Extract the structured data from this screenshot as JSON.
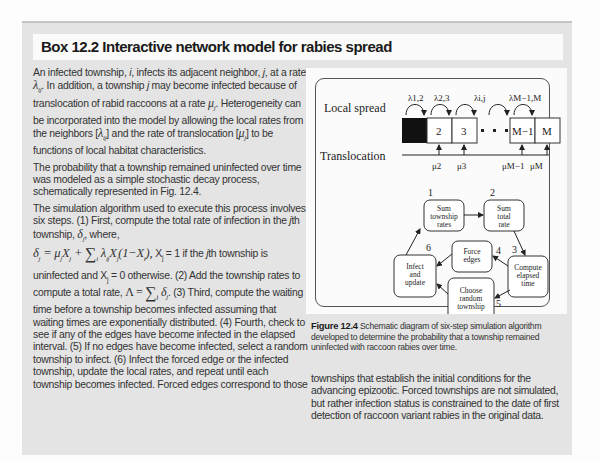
{
  "box": {
    "title": "Box 12.2  Interactive network model for rabies spread"
  },
  "left_column": {
    "paragraphs": [
      "An infected township, i, infects its adjacent neighbor, j, at a rate λij. In addition, a township j may become infected because of translocation of rabid raccoons at a rate μj. Heterogeneity can be incorporated into the model by allowing the local rates from the neighbors [λij] and the rate of translocation [μj] to be functions of local habitat characteristics.",
      "The probability that a township remained uninfected over time was modeled as a simple stochastic decay process, schematically represented in Fig. 12.4.",
      "The simulation algorithm used to execute this process involves six steps. (1) First, compute the total rate of infection in the jth township, δj, where,"
    ],
    "equation": "δj = μjXj + Σi λijXj(1−Xi), Xj = 1 if the jth township is",
    "paragraph_cont": "uninfected and Xj = 0 otherwise. (2) Add the township rates to compute a total rate, Λ = Σj δj. (3) Third, compute the waiting time before a township becomes infected assuming that waiting times are exponentially distributed. (4) Fourth, check to see if any of the edges have become infected in the elapsed interval. (5) If no edges have become infected, select a random township to infect. (6) Infect the forced edge or the infected township, update the local rates, and repeat until each township becomes infected. Forced edges correspond to those"
  },
  "figure": {
    "local_spread_label": "Local spread",
    "translocation_label": "Translocation",
    "lambda_labels": [
      "λ1,2",
      "λ2,3",
      "λi,j",
      "λM−1,M"
    ],
    "mu_labels": [
      "μ2",
      "μ3",
      "μM−1",
      "μM"
    ],
    "cells": [
      "",
      "2",
      "3",
      "M−1",
      "M"
    ],
    "steps": [
      {
        "num": "1",
        "label": [
          "Sum",
          "township",
          "rates"
        ]
      },
      {
        "num": "2",
        "label": [
          "Sum",
          "total",
          "rate"
        ]
      },
      {
        "num": "3",
        "label": [
          "Compute",
          "elapsed",
          "time"
        ]
      },
      {
        "num": "4",
        "label": [
          "Force",
          "edges"
        ]
      },
      {
        "num": "5",
        "label": [
          "Choose",
          "random",
          "township"
        ]
      },
      {
        "num": "6",
        "label": [
          "Infect",
          "and",
          "update"
        ]
      }
    ],
    "caption_label": "Figure 12.4",
    "caption_text": "Schematic diagram of six-step simulation algorithm developed to determine the probability that a township remained uninfected with raccoon rabies over time."
  },
  "right_column": {
    "text": "townships that establish the initial conditions for the advancing epizootic. Forced townships are not simulated, but rather infection status is constrained to the date of first detection of raccoon variant rabies in the original data."
  }
}
